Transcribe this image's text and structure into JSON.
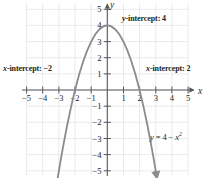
{
  "chart_data": {
    "type": "line",
    "title": "",
    "subtitle": "",
    "xlabel": "x",
    "ylabel": "y",
    "equation": "y = 4 − x",
    "equation_exponent": "2",
    "xlim": [
      -5.8,
      5.8
    ],
    "ylim": [
      -5.8,
      5.8
    ],
    "grid": true,
    "legend_position": "none",
    "x_ticks": [
      -5,
      -4,
      -3,
      -2,
      -1,
      1,
      2,
      3,
      4,
      5
    ],
    "x_tick_labels": [
      "−5",
      "−4",
      "−3",
      "−2",
      "−1",
      "1",
      "2",
      "3",
      "4",
      "5"
    ],
    "y_ticks": [
      5,
      4,
      3,
      2,
      1,
      -1,
      -2,
      -3,
      -4,
      -5
    ],
    "y_tick_labels": [
      "5",
      "4",
      "3",
      "2",
      "1",
      "−1",
      "−2",
      "−3",
      "−4",
      "−5"
    ],
    "curve_color": "#8a8a8f",
    "axis_color": "#58585b",
    "grid_color": "#dcdce0",
    "series": [
      {
        "name": "y = 4 - x^2",
        "x": [
          -3.08,
          -2.9,
          -2.7,
          -2.5,
          -2.25,
          -2.0,
          -1.75,
          -1.5,
          -1.25,
          -1.0,
          -0.75,
          -0.5,
          -0.25,
          0,
          0.25,
          0.5,
          0.75,
          1.0,
          1.25,
          1.5,
          1.75,
          2.0,
          2.25,
          2.5,
          2.7,
          2.9,
          3.08
        ],
        "y": [
          -5.49,
          -4.41,
          -3.29,
          -2.25,
          -1.06,
          0.0,
          0.94,
          1.75,
          2.44,
          3.0,
          3.44,
          3.75,
          3.94,
          4.0,
          3.94,
          3.75,
          3.44,
          3.0,
          2.44,
          1.75,
          0.94,
          0.0,
          -1.06,
          -2.25,
          -3.29,
          -4.41,
          -5.49
        ]
      }
    ],
    "annotations": [
      {
        "id": "y-intercept",
        "text": "y-intercept: 4",
        "italic_prefix": "y",
        "rest": "-intercept: 4"
      },
      {
        "id": "x-intercept-neg",
        "text": "x-intercept: −2",
        "italic_prefix": "x",
        "rest": "-intercept: −2"
      },
      {
        "id": "x-intercept-pos",
        "text": "x-intercept: 2",
        "italic_prefix": "x",
        "rest": "-intercept: 2"
      },
      {
        "id": "equation",
        "text": "y = 4 − x²"
      }
    ]
  },
  "annotations": {
    "y_intercept": {
      "italic": "y",
      "rest": "-intercept: 4"
    },
    "x_intercept_neg": {
      "italic": "x",
      "rest": "-intercept: −2"
    },
    "x_intercept_pos": {
      "italic": "x",
      "rest": "-intercept: 2"
    },
    "equation": {
      "lhs": "y",
      "mid": " = 4 − ",
      "var": "x",
      "exp": "2"
    }
  },
  "axes": {
    "x_axis_label": "x",
    "y_axis_label": "y"
  }
}
